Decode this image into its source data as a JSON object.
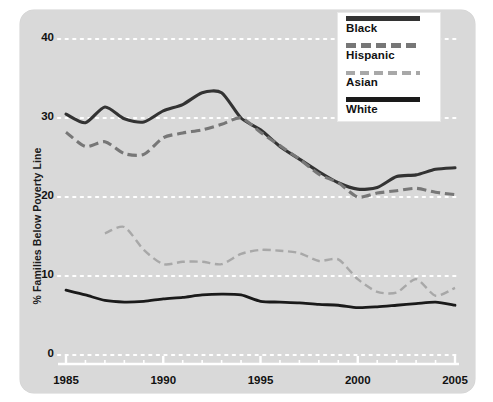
{
  "chart_data": {
    "type": "line",
    "title": "",
    "subtitle": "",
    "xlabel": "",
    "ylabel": "% Families Below Poverty Line",
    "xlim": [
      1985,
      2005
    ],
    "ylim": [
      0,
      40
    ],
    "grid": "horizontal-dotted-white",
    "legend_position": "top-right",
    "x": [
      1985,
      1986,
      1987,
      1988,
      1989,
      1990,
      1991,
      1992,
      1993,
      1994,
      1995,
      1996,
      1997,
      1998,
      1999,
      2000,
      2001,
      2002,
      2003,
      2004,
      2005
    ],
    "xticks": [
      1985,
      1990,
      1995,
      2000,
      2005
    ],
    "yticks": [
      0,
      10,
      20,
      30,
      40
    ],
    "series": [
      {
        "name": "Black",
        "style": "solid",
        "color": "#333333",
        "width": 3.1,
        "values": [
          30.5,
          29.4,
          31.4,
          29.9,
          29.5,
          30.9,
          31.7,
          33.2,
          33.2,
          30.0,
          28.5,
          26.4,
          24.8,
          23.2,
          21.8,
          21.0,
          21.2,
          22.6,
          22.8,
          23.5,
          23.7
        ]
      },
      {
        "name": "Hispanic",
        "style": "dashed",
        "color": "#777777",
        "width": 3.1,
        "values": [
          28.2,
          26.4,
          27.0,
          25.5,
          25.4,
          27.5,
          28.1,
          28.5,
          29.2,
          30.0,
          28.2,
          26.5,
          24.8,
          22.9,
          21.8,
          20.0,
          20.5,
          20.8,
          21.1,
          20.6,
          20.3
        ]
      },
      {
        "name": "Asian",
        "style": "dashed-fine",
        "color": "#a8a8a8",
        "width": 2.4,
        "values": [
          null,
          null,
          15.4,
          16.2,
          13.3,
          11.5,
          11.8,
          11.8,
          11.5,
          12.8,
          13.3,
          13.2,
          12.9,
          11.9,
          12.1,
          9.6,
          8.0,
          7.9,
          9.6,
          7.5,
          8.5
        ]
      },
      {
        "name": "White",
        "style": "solid",
        "color": "#1a1a1a",
        "width": 2.8,
        "values": [
          8.2,
          7.6,
          6.9,
          6.7,
          6.8,
          7.1,
          7.3,
          7.6,
          7.7,
          7.6,
          6.8,
          6.7,
          6.6,
          6.4,
          6.3,
          6.0,
          6.1,
          6.3,
          6.5,
          6.7,
          6.3
        ]
      }
    ]
  },
  "axes": {
    "y_axis_label": "% Families Below Poverty Line",
    "y_tick_labels": [
      "40",
      "30",
      "20",
      "10",
      "0"
    ],
    "x_tick_labels": [
      "1985",
      "1990",
      "1995",
      "2000",
      "2005"
    ]
  },
  "legend": {
    "entries": [
      {
        "label": "Black"
      },
      {
        "label": "Hispanic"
      },
      {
        "label": "Asian"
      },
      {
        "label": "White"
      }
    ]
  },
  "colors": {
    "panel_background": "#d9d9d9",
    "page_background": "#ffffff",
    "gridline": "#ffffff",
    "axis_line": "#ffffff",
    "text": "#111111",
    "series_black": "#333333",
    "series_hispanic": "#777777",
    "series_asian": "#a8a8a8",
    "series_white": "#1a1a1a"
  }
}
